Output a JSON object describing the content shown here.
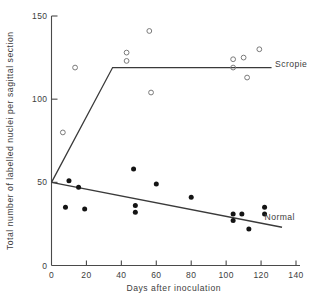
{
  "chart_data": {
    "type": "scatter",
    "title": "",
    "xlabel": "Days after inoculation",
    "ylabel": "Total number of labelled nuclei per sagittal section",
    "xlim": [
      0,
      140
    ],
    "ylim": [
      0,
      150
    ],
    "xticks": [
      0,
      20,
      40,
      60,
      80,
      100,
      120,
      140
    ],
    "yticks": [
      0,
      50,
      100,
      150
    ],
    "xtick_labels": [
      "0",
      "20",
      "40",
      "60",
      "80",
      "100",
      "120",
      "140"
    ],
    "ytick_labels": [
      "0",
      "50",
      "100",
      "150"
    ],
    "grid": false,
    "legend_position": "inline-right",
    "series": [
      {
        "name": "Scropie",
        "marker": "open-circle",
        "label_x": 128,
        "label_y": 121,
        "points": [
          {
            "x": 6.5,
            "y": 80
          },
          {
            "x": 13.5,
            "y": 119
          },
          {
            "x": 56,
            "y": 141
          },
          {
            "x": 43,
            "y": 128
          },
          {
            "x": 43,
            "y": 123
          },
          {
            "x": 57,
            "y": 104
          },
          {
            "x": 104,
            "y": 119
          },
          {
            "x": 104,
            "y": 124
          },
          {
            "x": 110,
            "y": 125
          },
          {
            "x": 119,
            "y": 130
          },
          {
            "x": 112,
            "y": 113
          }
        ],
        "fit": {
          "type": "broken-line",
          "vertices": [
            {
              "x": 0,
              "y": 50
            },
            {
              "x": 35,
              "y": 119
            },
            {
              "x": 126,
              "y": 119
            }
          ]
        }
      },
      {
        "name": "Normal",
        "marker": "filled-circle",
        "label_x": 122,
        "label_y": 29,
        "points": [
          {
            "x": 10,
            "y": 51
          },
          {
            "x": 15.5,
            "y": 47
          },
          {
            "x": 8,
            "y": 35
          },
          {
            "x": 19,
            "y": 34
          },
          {
            "x": 47,
            "y": 58
          },
          {
            "x": 48,
            "y": 36
          },
          {
            "x": 48,
            "y": 32
          },
          {
            "x": 60,
            "y": 49
          },
          {
            "x": 80,
            "y": 41
          },
          {
            "x": 104,
            "y": 31
          },
          {
            "x": 104,
            "y": 27
          },
          {
            "x": 109,
            "y": 31
          },
          {
            "x": 113,
            "y": 22
          },
          {
            "x": 122,
            "y": 35
          },
          {
            "x": 122,
            "y": 31
          }
        ],
        "fit": {
          "type": "line",
          "vertices": [
            {
              "x": 0,
              "y": 50
            },
            {
              "x": 132,
              "y": 23
            }
          ]
        }
      }
    ]
  }
}
